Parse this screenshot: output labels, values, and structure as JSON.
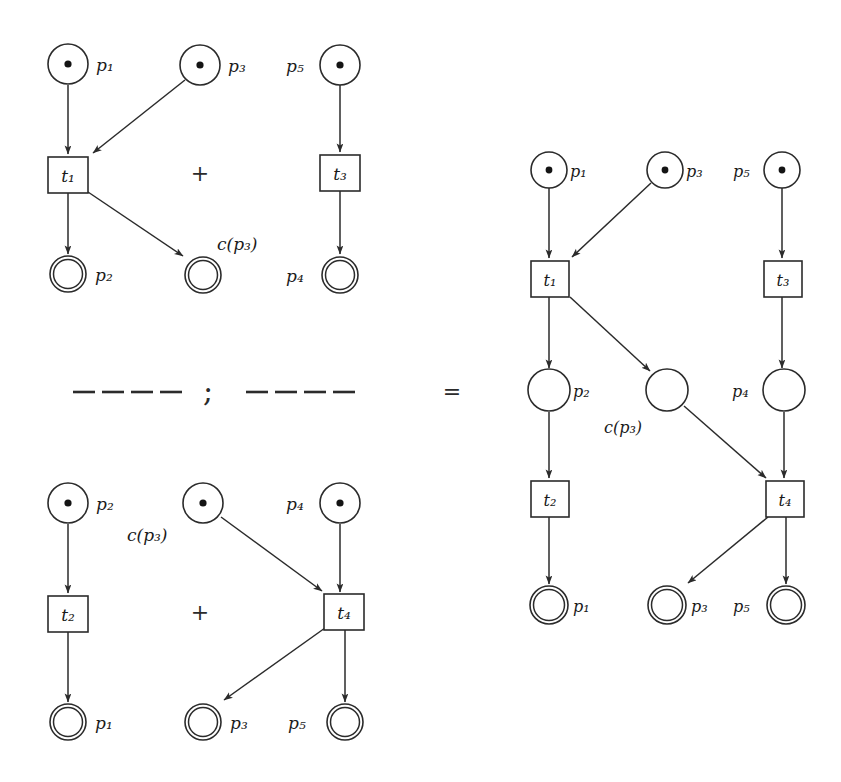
{
  "figure": {
    "kind": "petri-net-composition",
    "operators": {
      "plus": "+",
      "semicolon": ";",
      "equals": "=",
      "dash": "—"
    },
    "labels": {
      "p1": "p₁",
      "p2": "p₂",
      "p3": "p₃",
      "p4": "p₄",
      "p5": "p₅",
      "t1": "t₁",
      "t2": "t₂",
      "t3": "t₃",
      "t4": "t₄",
      "cp3": "c(p₃)"
    },
    "colors": {
      "ink": "#2b2b2b",
      "token": "#141414",
      "paper": "#ffffff"
    }
  },
  "panels": [
    {
      "id": "top-left",
      "name": "first-summand-net",
      "operator": "+",
      "places": [
        {
          "id": "p1",
          "label": "p₁",
          "type": "source",
          "token": true,
          "label_side": "right"
        },
        {
          "id": "p3",
          "label": "p₃",
          "type": "source",
          "token": true,
          "label_side": "right"
        },
        {
          "id": "p5",
          "label": "p₅",
          "type": "source",
          "token": true,
          "label_side": "left"
        },
        {
          "id": "p2",
          "label": "p₂",
          "type": "sink",
          "token": false,
          "label_side": "right"
        },
        {
          "id": "cp3",
          "label": "c(p₃)",
          "type": "sink",
          "token": false,
          "label_side": "above-right"
        },
        {
          "id": "p4",
          "label": "p₄",
          "type": "sink",
          "token": false,
          "label_side": "left"
        }
      ],
      "transitions": [
        {
          "id": "t1",
          "label": "t₁"
        },
        {
          "id": "t3",
          "label": "t₃"
        }
      ],
      "arcs": [
        {
          "from": "p1",
          "to": "t1"
        },
        {
          "from": "p3",
          "to": "t1"
        },
        {
          "from": "t1",
          "to": "p2"
        },
        {
          "from": "t1",
          "to": "cp3"
        },
        {
          "from": "p5",
          "to": "t3"
        },
        {
          "from": "t3",
          "to": "p4"
        }
      ]
    },
    {
      "id": "bottom-left",
      "name": "second-summand-net",
      "operator": "+",
      "places": [
        {
          "id": "p2",
          "label": "p₂",
          "type": "source",
          "token": true,
          "label_side": "right"
        },
        {
          "id": "cp3",
          "label": "c(p₃)",
          "type": "source",
          "token": true,
          "label_side": "below-left"
        },
        {
          "id": "p4",
          "label": "p₄",
          "type": "source",
          "token": true,
          "label_side": "left"
        },
        {
          "id": "p1",
          "label": "p₁",
          "type": "sink",
          "token": false,
          "label_side": "right"
        },
        {
          "id": "p3",
          "label": "p₃",
          "type": "sink",
          "token": false,
          "label_side": "right"
        },
        {
          "id": "p5",
          "label": "p₅",
          "type": "sink",
          "token": false,
          "label_side": "left"
        }
      ],
      "transitions": [
        {
          "id": "t2",
          "label": "t₂"
        },
        {
          "id": "t4",
          "label": "t₄"
        }
      ],
      "arcs": [
        {
          "from": "p2",
          "to": "t2"
        },
        {
          "from": "t2",
          "to": "p1"
        },
        {
          "from": "cp3",
          "to": "t4"
        },
        {
          "from": "p4",
          "to": "t4"
        },
        {
          "from": "t4",
          "to": "p3"
        },
        {
          "from": "t4",
          "to": "p5"
        }
      ]
    },
    {
      "id": "right",
      "name": "composed-net",
      "operator": "=",
      "places": [
        {
          "id": "p1t",
          "label": "p₁",
          "type": "source",
          "token": true,
          "label_side": "right"
        },
        {
          "id": "p3t",
          "label": "p₃",
          "type": "source",
          "token": true,
          "label_side": "right"
        },
        {
          "id": "p5t",
          "label": "p₅",
          "type": "source",
          "token": true,
          "label_side": "left"
        },
        {
          "id": "p2m",
          "label": "p₂",
          "type": "internal",
          "token": false,
          "label_side": "right"
        },
        {
          "id": "cp3m",
          "label": "c(p₃)",
          "type": "internal",
          "token": false,
          "label_side": "below-left"
        },
        {
          "id": "p4m",
          "label": "p₄",
          "type": "internal",
          "token": false,
          "label_side": "left"
        },
        {
          "id": "p1b",
          "label": "p₁",
          "type": "sink",
          "token": false,
          "label_side": "right"
        },
        {
          "id": "p3b",
          "label": "p₃",
          "type": "sink",
          "token": false,
          "label_side": "right"
        },
        {
          "id": "p5b",
          "label": "p₅",
          "type": "sink",
          "token": false,
          "label_side": "left"
        }
      ],
      "transitions": [
        {
          "id": "t1",
          "label": "t₁"
        },
        {
          "id": "t3",
          "label": "t₃"
        },
        {
          "id": "t2",
          "label": "t₂"
        },
        {
          "id": "t4",
          "label": "t₄"
        }
      ],
      "arcs": [
        {
          "from": "p1t",
          "to": "t1"
        },
        {
          "from": "p3t",
          "to": "t1"
        },
        {
          "from": "t1",
          "to": "p2m"
        },
        {
          "from": "t1",
          "to": "cp3m"
        },
        {
          "from": "p5t",
          "to": "t3"
        },
        {
          "from": "t3",
          "to": "p4m"
        },
        {
          "from": "p2m",
          "to": "t2"
        },
        {
          "from": "t2",
          "to": "p1b"
        },
        {
          "from": "cp3m",
          "to": "t4"
        },
        {
          "from": "p4m",
          "to": "t4"
        },
        {
          "from": "t4",
          "to": "p3b"
        },
        {
          "from": "t4",
          "to": "p5b"
        }
      ]
    }
  ],
  "separator": {
    "left_dashes": 4,
    "right_dashes": 4,
    "semicolon": ";",
    "equals": "="
  }
}
